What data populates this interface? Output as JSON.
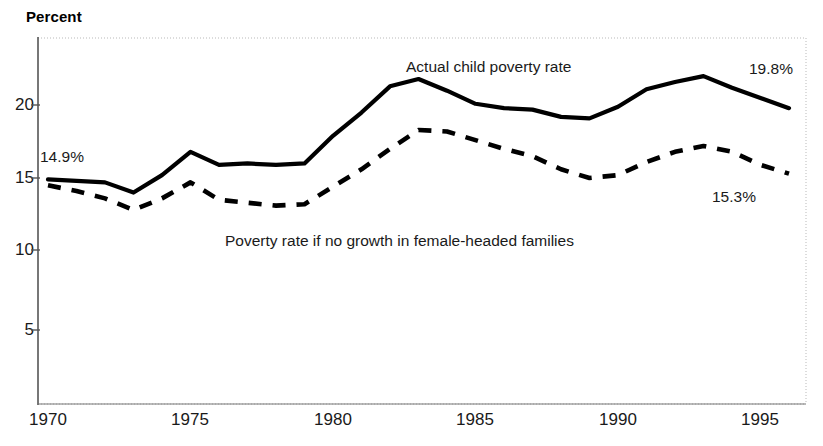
{
  "chart": {
    "axis_title": "Percent",
    "y_ticks": [
      5,
      10,
      15,
      20
    ],
    "x_ticks": [
      1970,
      1975,
      1980,
      1985,
      1990,
      1995
    ],
    "annotations": {
      "start_value": "14.9%",
      "actual_series_label": "Actual child poverty rate",
      "end_value_actual": "19.8%",
      "counterfactual_series_label": "Poverty rate if no growth in female-headed families",
      "end_value_counterfactual": "15.3%"
    }
  },
  "chart_data": {
    "type": "line",
    "title": "",
    "subtitle": "",
    "xlabel": "",
    "ylabel": "Percent",
    "xlim": [
      1970,
      1996
    ],
    "ylim": [
      0,
      24
    ],
    "yticks": [
      5,
      10,
      15,
      20
    ],
    "xticks": [
      1970,
      1975,
      1980,
      1985,
      1990,
      1995
    ],
    "grid": false,
    "legend": "inline-annotations",
    "x": [
      1970,
      1971,
      1972,
      1973,
      1974,
      1975,
      1976,
      1977,
      1978,
      1979,
      1980,
      1981,
      1982,
      1983,
      1984,
      1985,
      1986,
      1987,
      1988,
      1989,
      1990,
      1991,
      1992,
      1993,
      1994,
      1995,
      1996
    ],
    "series": [
      {
        "name": "Actual child poverty rate",
        "style": "solid",
        "color": "#000000",
        "values": [
          14.9,
          14.8,
          14.7,
          14.0,
          15.2,
          16.8,
          15.9,
          16.0,
          15.9,
          16.0,
          17.9,
          19.5,
          21.3,
          21.8,
          21.0,
          20.1,
          19.8,
          19.7,
          19.2,
          19.1,
          19.9,
          21.1,
          21.6,
          22.0,
          21.2,
          20.5,
          19.8
        ]
      },
      {
        "name": "Poverty rate if no growth in female-headed families",
        "style": "dashed",
        "color": "#000000",
        "values": [
          14.5,
          14.1,
          13.6,
          12.8,
          13.6,
          14.7,
          13.5,
          13.3,
          13.1,
          13.2,
          14.4,
          15.6,
          17.0,
          18.3,
          18.2,
          17.6,
          17.0,
          16.5,
          15.6,
          15.0,
          15.2,
          16.1,
          16.8,
          17.2,
          16.8,
          15.9,
          15.3
        ]
      }
    ],
    "annotations": [
      {
        "text": "14.9%",
        "x": 1970.3,
        "y": 16.5
      },
      {
        "text": "Actual child poverty rate",
        "x": 1984.0,
        "y": 23.0
      },
      {
        "text": "19.8%",
        "x": 1995.4,
        "y": 22.7
      },
      {
        "text": "Poverty rate if no growth in female-headed families",
        "x": 1981.0,
        "y": 11.2
      },
      {
        "text": "15.3%",
        "x": 1993.5,
        "y": 13.3
      }
    ]
  }
}
